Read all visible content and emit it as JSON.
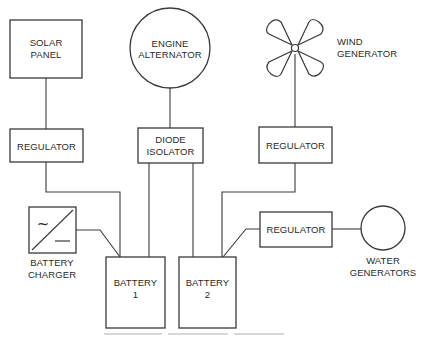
{
  "diagram": {
    "type": "block-diagram",
    "nodes": {
      "solar_panel": {
        "label_line1": "SOLAR",
        "label_line2": "PANEL",
        "shape": "rectangle"
      },
      "engine_alternator": {
        "label_line1": "ENGINE",
        "label_line2": "ALTERNATOR",
        "shape": "circle"
      },
      "wind_generator": {
        "label_line1": "WIND",
        "label_line2": "GENERATOR",
        "shape": "propeller-icon"
      },
      "regulator_solar": {
        "label": "REGULATOR",
        "shape": "rectangle"
      },
      "diode_isolator": {
        "label_line1": "DIODE",
        "label_line2": "ISOLATOR",
        "shape": "rectangle"
      },
      "regulator_wind": {
        "label": "REGULATOR",
        "shape": "rectangle"
      },
      "regulator_water": {
        "label": "REGULATOR",
        "shape": "rectangle"
      },
      "water_generators": {
        "label_line1": "WATER",
        "label_line2": "GENERATORS",
        "shape": "circle"
      },
      "battery_charger": {
        "label_line1": "BATTERY",
        "label_line2": "CHARGER",
        "shape": "ac-dc-converter-icon",
        "symbol_ac": "~",
        "symbol_dc": "—"
      },
      "battery_1": {
        "label_line1": "BATTERY",
        "label_line2": "1",
        "shape": "rectangle"
      },
      "battery_2": {
        "label_line1": "BATTERY",
        "label_line2": "2",
        "shape": "rectangle"
      }
    },
    "edges": [
      {
        "from": "solar_panel",
        "to": "regulator_solar"
      },
      {
        "from": "regulator_solar",
        "to": "battery_1"
      },
      {
        "from": "engine_alternator",
        "to": "diode_isolator"
      },
      {
        "from": "diode_isolator",
        "to": "battery_1"
      },
      {
        "from": "diode_isolator",
        "to": "battery_2"
      },
      {
        "from": "wind_generator",
        "to": "regulator_wind"
      },
      {
        "from": "regulator_wind",
        "to": "battery_2"
      },
      {
        "from": "water_generators",
        "to": "regulator_water"
      },
      {
        "from": "regulator_water",
        "to": "battery_2"
      },
      {
        "from": "battery_charger",
        "to": "battery_1"
      }
    ],
    "colors": {
      "line": "#3a3a3a",
      "text": "#2a2a2a",
      "background": "#ffffff"
    }
  }
}
